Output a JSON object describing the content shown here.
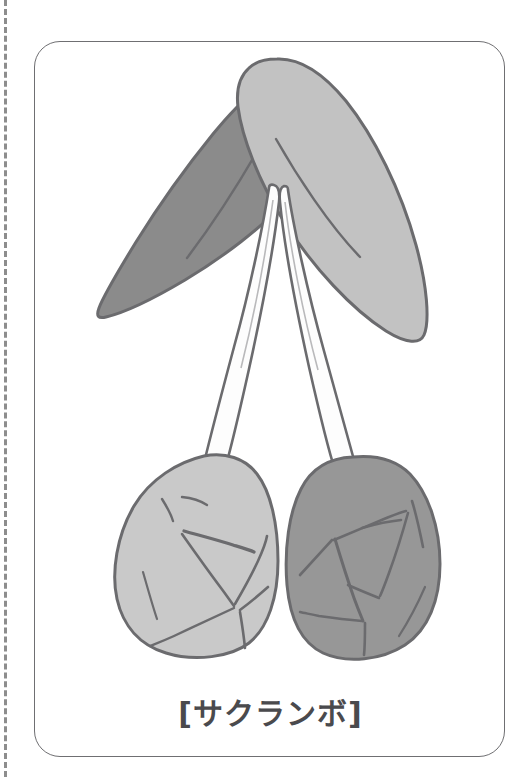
{
  "card": {
    "caption": "[サクランボ]",
    "border_color": "#6f6f72",
    "background_color": "#ffffff"
  },
  "tear_line": {
    "style": "dashed",
    "color": "#8d8d8d"
  },
  "illustration": {
    "subject": "cherries",
    "outline_color": "#6b6b6e",
    "parts": [
      {
        "name": "leaf-left",
        "fill": "#8b8b8b",
        "label": "dark leaf pointing lower-left"
      },
      {
        "name": "leaf-right",
        "fill": "#c2c2c2",
        "label": "light leaf pointing lower-right"
      },
      {
        "name": "stem-left",
        "fill": "#fdfdfd",
        "label": "left stem"
      },
      {
        "name": "stem-right",
        "fill": "#fdfdfd",
        "label": "right stem"
      },
      {
        "name": "cherry-left",
        "fill": "#c9c9c9",
        "label": "light cherry fruit"
      },
      {
        "name": "cherry-right",
        "fill": "#979797",
        "label": "dark cherry fruit"
      }
    ]
  }
}
